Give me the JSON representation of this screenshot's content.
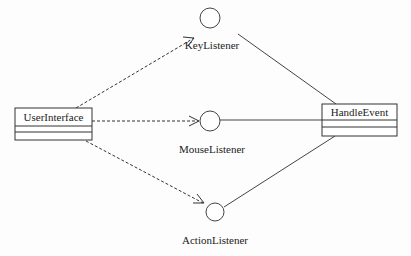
{
  "diagram": {
    "type": "uml-class-interface",
    "classes": [
      {
        "name": "UserInterface"
      },
      {
        "name": "HandleEvent"
      }
    ],
    "interfaces": [
      {
        "name": "KeyListener"
      },
      {
        "name": "MouseListener"
      },
      {
        "name": "ActionListener"
      }
    ],
    "relations": [
      {
        "from": "UserInterface",
        "to": "KeyListener",
        "style": "dashed-arrow",
        "meaning": "dependency"
      },
      {
        "from": "UserInterface",
        "to": "MouseListener",
        "style": "dashed-arrow",
        "meaning": "dependency"
      },
      {
        "from": "UserInterface",
        "to": "ActionListener",
        "style": "dashed-arrow",
        "meaning": "dependency"
      },
      {
        "from": "HandleEvent",
        "to": "KeyListener",
        "style": "solid-line",
        "meaning": "realization (lollipop)"
      },
      {
        "from": "HandleEvent",
        "to": "MouseListener",
        "style": "solid-line",
        "meaning": "realization (lollipop)"
      },
      {
        "from": "HandleEvent",
        "to": "ActionListener",
        "style": "solid-line",
        "meaning": "realization (lollipop)"
      }
    ]
  }
}
